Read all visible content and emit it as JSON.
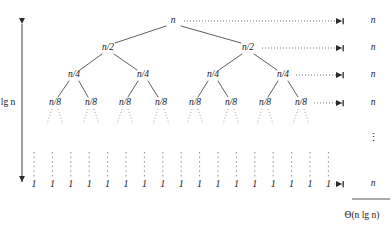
{
  "figure": {
    "name": "merge-sort-recursion-tree",
    "background_color": "#ffffff",
    "ink_color": "#1a1a1a",
    "width": 392,
    "height": 237
  },
  "depth_label": {
    "prefix": "lg ",
    "variable": "n",
    "text": "lg n"
  },
  "tree": {
    "levels": [
      {
        "index": 0,
        "node_label": "n",
        "nodes": [
          {
            "label": "n",
            "x": 173,
            "y": 21
          }
        ]
      },
      {
        "index": 1,
        "node_label": "n/2",
        "nodes": [
          {
            "label": "n/2",
            "x": 108,
            "y": 48
          },
          {
            "label": "n/2",
            "x": 248,
            "y": 48
          }
        ]
      },
      {
        "index": 2,
        "node_label": "n/4",
        "nodes": [
          {
            "label": "n/4",
            "x": 74,
            "y": 75
          },
          {
            "label": "n/4",
            "x": 143,
            "y": 75
          },
          {
            "label": "n/4",
            "x": 213,
            "y": 75
          },
          {
            "label": "n/4",
            "x": 283,
            "y": 75
          }
        ]
      },
      {
        "index": 3,
        "node_label": "n/8",
        "nodes": [
          {
            "label": "n/8",
            "x": 55,
            "y": 103
          },
          {
            "label": "n/8",
            "x": 91,
            "y": 103
          },
          {
            "label": "n/8",
            "x": 125,
            "y": 103
          },
          {
            "label": "n/8",
            "x": 161,
            "y": 103
          },
          {
            "label": "n/8",
            "x": 195,
            "y": 103
          },
          {
            "label": "n/8",
            "x": 231,
            "y": 103
          },
          {
            "label": "n/8",
            "x": 265,
            "y": 103
          },
          {
            "label": "n/8",
            "x": 301,
            "y": 103
          }
        ]
      }
    ],
    "leaf_label": "1",
    "leaf_count": 17,
    "leaf_y": 184,
    "leaf_x_start": 34,
    "leaf_x_step": 18.4
  },
  "level_costs": [
    {
      "label": "n",
      "y": 21,
      "x": 373
    },
    {
      "label": "n",
      "y": 48,
      "x": 373
    },
    {
      "label": "n",
      "y": 75,
      "x": 373
    },
    {
      "label": "n",
      "y": 103,
      "x": 373
    },
    {
      "label": "n",
      "y": 184,
      "x": 373
    }
  ],
  "ellipsis": {
    "glyph": "⋮",
    "x": 373,
    "y": 137
  },
  "total": {
    "rule_y": 199,
    "rule_x1": 352,
    "rule_x2": 392,
    "label": "Θ(n lg n)",
    "x": 362,
    "y": 216
  }
}
